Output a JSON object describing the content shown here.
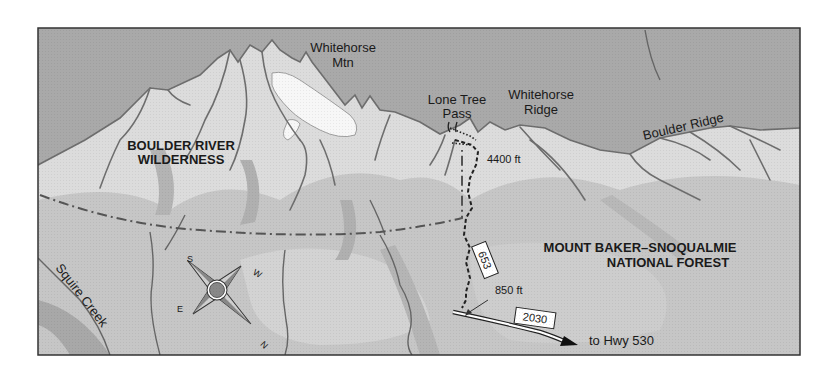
{
  "map": {
    "title": "Lone Tree Pass trail area map",
    "colors": {
      "sky": "#a9a9a9",
      "slope_light": "#e6e6e6",
      "slope_mid": "#c8c8c8",
      "slope_dark": "#b3b3b3",
      "valley": "#bdbdbd",
      "ridge_line": "#6e6e6e",
      "snow": "#f7f7f7",
      "frame": "#333333",
      "trail": "#222222",
      "boundary": "#555555",
      "compass_center": "#888888"
    },
    "labels": {
      "peak": {
        "line1": "Whitehorse",
        "line2": "Mtn"
      },
      "pass": {
        "line1": "Lone Tree",
        "line2": "Pass"
      },
      "ridge1": {
        "line1": "Whitehorse",
        "line2": "Ridge"
      },
      "ridge2": "Boulder Ridge",
      "wilderness": {
        "line1": "BOULDER RIVER",
        "line2": "WILDERNESS"
      },
      "forest": {
        "line1": "MOUNT BAKER–SNOQUALMIE",
        "line2": "NATIONAL FOREST"
      },
      "creek": "Squire Creek",
      "elev_top": "4400 ft",
      "elev_bottom": "850 ft",
      "trail_number": "653",
      "road_number": "2030",
      "road_dest": "to Hwy 530"
    },
    "compass": {
      "s": "S",
      "w": "W",
      "e": "E",
      "n": "N"
    }
  }
}
